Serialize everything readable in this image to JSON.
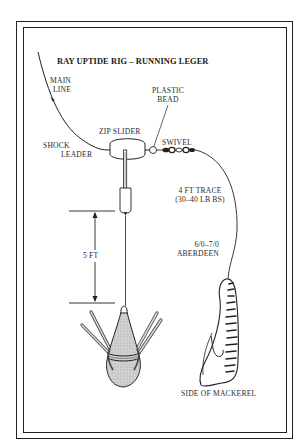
{
  "title": "RAY UPTIDE RIG – RUNNING LEGER",
  "labels": {
    "main_line": [
      "MAIN",
      "LINE"
    ],
    "plastic_bead": [
      "PLASTIC",
      "BEAD"
    ],
    "zip_slider": "ZIP SLIDER",
    "swivel": "SWIVEL",
    "shock_leader": [
      "SHOCK",
      "LEADER"
    ],
    "trace": [
      "4 FT TRACE",
      "(30–40 LB BS)"
    ],
    "distance": "5 FT",
    "hook": [
      "6/0–7/0",
      "ABERDEEN"
    ],
    "bait": "SIDE OF MACKEREL"
  },
  "components": [
    {
      "name": "main-line",
      "icon": "fishing-line"
    },
    {
      "name": "shock-leader",
      "icon": "fishing-line"
    },
    {
      "name": "zip-slider",
      "icon": "slider-boom"
    },
    {
      "name": "plastic-bead",
      "icon": "bead-circle"
    },
    {
      "name": "swivel",
      "icon": "swivel"
    },
    {
      "name": "trace",
      "icon": "fishing-line"
    },
    {
      "name": "breakaway-sinker",
      "icon": "grip-lead-weight"
    },
    {
      "name": "hook-bait",
      "icon": "mackerel-side"
    }
  ],
  "colors": {
    "ink": "#222222",
    "sinker_fill": "#c8c8c8",
    "background": "#ffffff"
  }
}
